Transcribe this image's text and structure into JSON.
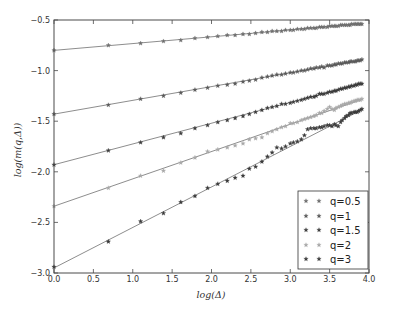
{
  "chart_data": {
    "type": "scatter",
    "title": "",
    "xlabel": "log(Δ)",
    "ylabel": "log(m(q,Δ))",
    "xlim": [
      0.0,
      4.0
    ],
    "ylim": [
      -3.0,
      -0.5
    ],
    "grid": false,
    "legend_position": "lower right",
    "xticks": [
      "0.0",
      "0.5",
      "1.0",
      "1.5",
      "2.0",
      "2.5",
      "3.0",
      "3.5",
      "4.0"
    ],
    "xtick_values": [
      0.0,
      0.5,
      1.0,
      1.5,
      2.0,
      2.5,
      3.0,
      3.5,
      4.0
    ],
    "yticks": [
      "−3.0",
      "−2.5",
      "−2.0",
      "−1.5",
      "−1.0",
      "−0.5"
    ],
    "ytick_values": [
      -3.0,
      -2.5,
      -2.0,
      -1.5,
      -1.0,
      -0.5
    ],
    "x": [
      0.0,
      0.69,
      1.1,
      1.39,
      1.61,
      1.79,
      1.95,
      2.08,
      2.2,
      2.3,
      2.4,
      2.48,
      2.56,
      2.64,
      2.71,
      2.77,
      2.83,
      2.89,
      2.94,
      3.0,
      3.04,
      3.09,
      3.14,
      3.18,
      3.22,
      3.26,
      3.3,
      3.33,
      3.37,
      3.4,
      3.43,
      3.47,
      3.5,
      3.53,
      3.56,
      3.58,
      3.61,
      3.64,
      3.66,
      3.69,
      3.71,
      3.74,
      3.76,
      3.78,
      3.81,
      3.83,
      3.85,
      3.87,
      3.89,
      3.91
    ],
    "series": [
      {
        "name": "q=0.5",
        "color": "#6e6e6e",
        "fit": {
          "intercept": -0.8,
          "slope": 0.067
        },
        "values": [
          -0.8,
          -0.75,
          -0.73,
          -0.71,
          -0.7,
          -0.68,
          -0.67,
          -0.66,
          -0.65,
          -0.65,
          -0.64,
          -0.64,
          -0.63,
          -0.62,
          -0.62,
          -0.61,
          -0.61,
          -0.61,
          -0.6,
          -0.6,
          -0.6,
          -0.59,
          -0.59,
          -0.59,
          -0.58,
          -0.58,
          -0.58,
          -0.58,
          -0.57,
          -0.57,
          -0.57,
          -0.57,
          -0.56,
          -0.56,
          -0.56,
          -0.56,
          -0.56,
          -0.55,
          -0.55,
          -0.55,
          -0.55,
          -0.55,
          -0.55,
          -0.54,
          -0.54,
          -0.54,
          -0.54,
          -0.54,
          -0.54,
          -0.54
        ]
      },
      {
        "name": "q=1",
        "color": "#5a5a5a",
        "fit": {
          "intercept": -1.43,
          "slope": 0.136
        },
        "values": [
          -1.43,
          -1.34,
          -1.28,
          -1.25,
          -1.22,
          -1.19,
          -1.17,
          -1.15,
          -1.14,
          -1.13,
          -1.11,
          -1.1,
          -1.09,
          -1.07,
          -1.06,
          -1.05,
          -1.04,
          -1.04,
          -1.03,
          -1.02,
          -1.02,
          -1.01,
          -1.0,
          -1.0,
          -0.99,
          -0.98,
          -0.98,
          -0.97,
          -0.97,
          -0.96,
          -0.97,
          -0.95,
          -0.95,
          -0.95,
          -0.94,
          -0.94,
          -0.93,
          -0.93,
          -0.93,
          -0.92,
          -0.92,
          -0.92,
          -0.91,
          -0.91,
          -0.91,
          -0.91,
          -0.9,
          -0.9,
          -0.9,
          -0.89
        ]
      },
      {
        "name": "q=1.5",
        "color": "#3c3c3c",
        "fit": {
          "intercept": -1.93,
          "slope": 0.205
        },
        "values": [
          -1.93,
          -1.79,
          -1.71,
          -1.66,
          -1.62,
          -1.57,
          -1.54,
          -1.51,
          -1.49,
          -1.47,
          -1.45,
          -1.43,
          -1.41,
          -1.39,
          -1.37,
          -1.36,
          -1.35,
          -1.33,
          -1.33,
          -1.32,
          -1.31,
          -1.3,
          -1.29,
          -1.28,
          -1.27,
          -1.26,
          -1.26,
          -1.25,
          -1.23,
          -1.23,
          -1.23,
          -1.22,
          -1.21,
          -1.21,
          -1.2,
          -1.2,
          -1.19,
          -1.18,
          -1.18,
          -1.17,
          -1.17,
          -1.16,
          -1.16,
          -1.15,
          -1.15,
          -1.14,
          -1.14,
          -1.13,
          -1.13,
          -1.13
        ]
      },
      {
        "name": "q=2",
        "color": "#a8a8a8",
        "fit": {
          "intercept": -2.34,
          "slope": 0.27
        },
        "values": [
          -2.34,
          -2.16,
          -2.04,
          -1.99,
          -1.91,
          -1.86,
          -1.8,
          -1.78,
          -1.76,
          -1.74,
          -1.72,
          -1.68,
          -1.67,
          -1.66,
          -1.62,
          -1.6,
          -1.58,
          -1.56,
          -1.55,
          -1.52,
          -1.52,
          -1.51,
          -1.49,
          -1.48,
          -1.47,
          -1.46,
          -1.45,
          -1.44,
          -1.42,
          -1.42,
          -1.4,
          -1.38,
          -1.36,
          -1.38,
          -1.39,
          -1.37,
          -1.36,
          -1.35,
          -1.34,
          -1.33,
          -1.33,
          -1.32,
          -1.32,
          -1.31,
          -1.3,
          -1.3,
          -1.29,
          -1.29,
          -1.29,
          -1.28
        ]
      },
      {
        "name": "q=3",
        "color": "#3a3a3a",
        "fit": {
          "intercept": -2.95,
          "slope": 0.4
        },
        "values": [
          -2.94,
          -2.69,
          -2.49,
          -2.41,
          -2.3,
          -2.24,
          -2.16,
          -2.12,
          -2.09,
          -2.06,
          -2.04,
          -1.97,
          -1.95,
          -1.9,
          -1.85,
          -1.81,
          -1.76,
          -1.77,
          -1.75,
          -1.72,
          -1.71,
          -1.7,
          -1.68,
          -1.64,
          -1.58,
          -1.57,
          -1.57,
          -1.57,
          -1.56,
          -1.56,
          -1.55,
          -1.54,
          -1.54,
          -1.55,
          -1.53,
          -1.54,
          -1.55,
          -1.51,
          -1.49,
          -1.47,
          -1.45,
          -1.44,
          -1.42,
          -1.42,
          -1.41,
          -1.41,
          -1.41,
          -1.4,
          -1.39,
          -1.38
        ]
      }
    ],
    "fit_line_color": "#707070",
    "axis_color": "#4a4a4a"
  }
}
